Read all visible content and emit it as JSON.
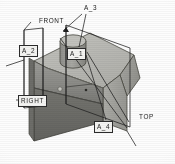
{
  "view": {
    "title": "Isometric datum plane view",
    "background_color": "#fdfdfd",
    "width": 175,
    "height": 164
  },
  "model": {
    "description": "Rectangular block with chamfered right end and cylindrical boss on top face",
    "colors": {
      "top_face": "#b9b9b4",
      "front_face": "#8e8e8a",
      "front_face_lower": "#6f6f6c",
      "right_face": "#a3a39e",
      "chamfer_face": "#9b9b96",
      "cylinder_side": "#9a9a95",
      "cylinder_top": "#c4c4bf",
      "outline": "#3a3a38",
      "datum_line": "#2a2a2a"
    }
  },
  "annotations": [
    {
      "id": "a3",
      "label": "A_3",
      "style": "plain",
      "x": 84,
      "y": 6,
      "name": "datum-label-a3"
    },
    {
      "id": "front",
      "label": "FRONT",
      "style": "plain",
      "x": 40,
      "y": 18,
      "name": "datum-label-front"
    },
    {
      "id": "a2",
      "label": "A_2",
      "style": "boxed",
      "x": 19,
      "y": 46,
      "name": "datum-label-a2"
    },
    {
      "id": "a1",
      "label": "A_1",
      "style": "boxed",
      "x": 67,
      "y": 49,
      "name": "datum-label-a1"
    },
    {
      "id": "right",
      "label": "RIGHT",
      "style": "boxed",
      "x": 18,
      "y": 96,
      "name": "datum-label-right"
    },
    {
      "id": "a4",
      "label": "A_4",
      "style": "boxed",
      "x": 94,
      "y": 122,
      "name": "datum-label-a4"
    },
    {
      "id": "top",
      "label": "TOP",
      "style": "plain",
      "x": 139,
      "y": 114,
      "name": "datum-label-top"
    }
  ],
  "datum_planes": [
    {
      "id": "left_plane",
      "name": "datum-plane-left",
      "label_ref": "A_2"
    },
    {
      "id": "right_plane",
      "name": "datum-plane-right",
      "label_ref": "TOP"
    },
    {
      "id": "mid_plane",
      "name": "datum-plane-mid",
      "label_ref": "FRONT"
    }
  ],
  "features": [
    {
      "id": "boss",
      "name": "cylindrical-boss",
      "type": "cylinder"
    },
    {
      "id": "chamfer",
      "name": "chamfer-face",
      "type": "planar"
    },
    {
      "id": "hole_mark",
      "name": "datum-point-marker",
      "type": "point"
    }
  ]
}
